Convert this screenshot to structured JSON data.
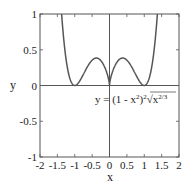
{
  "chart_data": {
    "type": "line",
    "title": "",
    "xlabel": "x",
    "ylabel": "y",
    "xlim": [
      -2,
      2
    ],
    "ylim": [
      -1,
      1
    ],
    "xticks": [
      "-2",
      "-1.5",
      "-1",
      "-0.5",
      "0",
      "0.5",
      "1",
      "1.5",
      "2"
    ],
    "yticks": [
      "-1",
      "-0.5",
      "0",
      "0.5",
      "1"
    ],
    "grid": false,
    "annotation": "y = (1 - x²)² ∛x^(2/3)",
    "series": [
      {
        "name": "y = (1 - x^2)^2 * x^(2/3)",
        "x": [
          -1.4,
          -1.3,
          -1.2,
          -1.1,
          -1.0,
          -0.9,
          -0.8,
          -0.7,
          -0.6,
          -0.5,
          -0.4,
          -0.3,
          -0.2,
          -0.1,
          0,
          0.1,
          0.2,
          0.3,
          0.4,
          0.5,
          0.6,
          0.7,
          0.8,
          0.9,
          1.0,
          1.1,
          1.2,
          1.3,
          1.4
        ],
        "values": [
          1.07,
          0.56,
          0.22,
          0.05,
          0.0,
          0.034,
          0.112,
          0.204,
          0.29,
          0.354,
          0.383,
          0.372,
          0.318,
          0.212,
          0.0,
          0.212,
          0.318,
          0.372,
          0.383,
          0.354,
          0.29,
          0.204,
          0.112,
          0.034,
          0.0,
          0.05,
          0.22,
          0.56,
          1.07
        ],
        "color": "#555555"
      }
    ]
  },
  "labels": {
    "xlabel": "x",
    "ylabel": "y",
    "annotation_prefix": "y = (1 - x",
    "annotation_mid": ")",
    "annotation_root": "√",
    "annotation_tail": "x",
    "annotation_exp1": "2",
    "annotation_exp2": "2",
    "annotation_exp3": "2/3"
  }
}
